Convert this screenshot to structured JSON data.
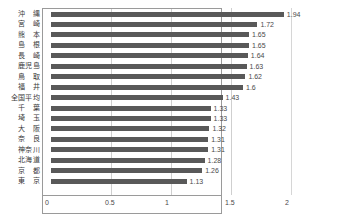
{
  "chart_data": {
    "type": "bar",
    "orientation": "horizontal",
    "title": "",
    "xlabel": "",
    "ylabel": "",
    "xlim": [
      0,
      2.5
    ],
    "xticks": [
      "0",
      "0.5",
      "1",
      "1.5",
      "2",
      "2.5"
    ],
    "xtick_values": [
      0,
      0.5,
      1,
      1.5,
      2,
      2.5
    ],
    "grid": true,
    "legend": "none",
    "bar_color": "#595959",
    "gridline_color": "#cfcfcf",
    "border_color": "#9a9a9a",
    "categories": [
      "沖　縄",
      "宮　崎",
      "熊　本",
      "島　根",
      "長　崎",
      "鹿児島",
      "鳥　取",
      "福　井",
      "全国平均",
      "千　葉",
      "埼　玉",
      "大　阪",
      "奈　良",
      "神奈川",
      "北海道",
      "京　都",
      "東　京"
    ],
    "values": [
      1.94,
      1.72,
      1.65,
      1.65,
      1.64,
      1.63,
      1.62,
      1.6,
      1.43,
      1.33,
      1.33,
      1.32,
      1.31,
      1.31,
      1.28,
      1.26,
      1.13
    ],
    "value_labels": [
      "1.94",
      "1.72",
      "1.65",
      "1.65",
      "1.64",
      "1.63",
      "1.62",
      "1.6",
      "1.43",
      "1.33",
      "1.33",
      "1.32",
      "1.31",
      "1.31",
      "1.28",
      "1.26",
      "1.13"
    ]
  }
}
